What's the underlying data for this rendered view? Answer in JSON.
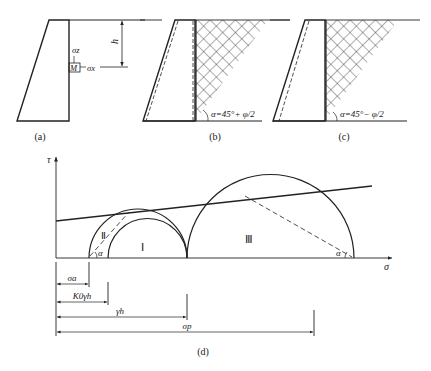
{
  "panels": {
    "a": {
      "caption": "(a)",
      "depth_label": "h",
      "point_label": "M",
      "vertical_stress_label": "σz",
      "horizontal_stress_label": "σx"
    },
    "b": {
      "caption": "(b)",
      "angle_label": "α=45°+ φ/2"
    },
    "c": {
      "caption": "(c)",
      "angle_label": "α=45°− φ/2"
    },
    "d": {
      "caption": "(d)",
      "y_axis_label": "τ",
      "x_axis_label": "σ",
      "circle_labels": [
        "Ⅰ",
        "Ⅱ",
        "Ⅲ"
      ],
      "angle_label_left": "α",
      "angle_label_right": "α",
      "dimension_labels": {
        "active": "σa",
        "at_rest": "K0γh",
        "vertical": "γh",
        "passive": "σp"
      }
    }
  },
  "colors": {
    "line": "#222222",
    "hatch": "#333333",
    "background": "#ffffff"
  }
}
